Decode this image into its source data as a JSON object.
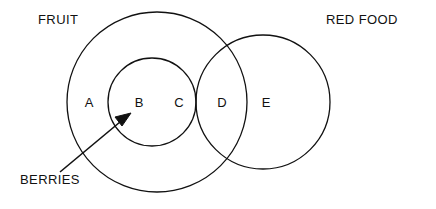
{
  "diagram": {
    "title_visible": false,
    "background_color": "#ffffff",
    "stroke_color": "#111111",
    "text_color": "#111111",
    "sets": [
      {
        "id": "fruit",
        "label": "FRUIT",
        "label_x": 38,
        "label_y": 24,
        "cx": 157,
        "cy": 102,
        "r": 90
      },
      {
        "id": "red-food",
        "label": "RED FOOD",
        "label_x": 326,
        "label_y": 24,
        "cx": 263,
        "cy": 102,
        "r": 67
      },
      {
        "id": "berries",
        "label": "",
        "cx": 152,
        "cy": 102,
        "r": 44
      }
    ],
    "regions": [
      {
        "id": "region-a",
        "label": "A",
        "x": 89,
        "y": 107
      },
      {
        "id": "region-b",
        "label": "B",
        "x": 139,
        "y": 107
      },
      {
        "id": "region-c",
        "label": "C",
        "x": 179,
        "y": 107
      },
      {
        "id": "region-d",
        "label": "D",
        "x": 222,
        "y": 107
      },
      {
        "id": "region-e",
        "label": "E",
        "x": 266,
        "y": 107
      }
    ],
    "callout": {
      "label": "BERRIES",
      "label_x": 20,
      "label_y": 184,
      "line_start_x": 60,
      "line_start_y": 172,
      "line_end_x": 128,
      "line_end_y": 116,
      "arrow_tip_x": 131,
      "arrow_tip_y": 113
    }
  }
}
